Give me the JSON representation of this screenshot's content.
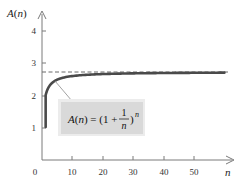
{
  "chart_data": {
    "type": "line",
    "title": "",
    "xlabel": "n",
    "ylabel": "A(n)",
    "xlim": [
      0,
      60
    ],
    "ylim": [
      0,
      4.6
    ],
    "x_ticks": [
      0,
      10,
      20,
      30,
      40,
      50
    ],
    "x_tick_labels": [
      "0",
      "10",
      "20",
      "30",
      "40",
      "50"
    ],
    "y_ticks": [
      1,
      2,
      3,
      4
    ],
    "y_tick_labels": [
      "1",
      "2",
      "3",
      "4"
    ],
    "grid": false,
    "legend": null,
    "series": [
      {
        "name": "A(n) = (1 + 1/n)^n",
        "function": "(1 + 1/n)^n",
        "domain": [
          1,
          60
        ],
        "x": [
          1,
          2,
          3,
          4,
          5,
          6,
          8,
          10,
          15,
          20,
          30,
          40,
          50,
          60
        ],
        "values": [
          2.0,
          2.25,
          2.37,
          2.441,
          2.488,
          2.522,
          2.566,
          2.594,
          2.633,
          2.653,
          2.674,
          2.685,
          2.692,
          2.696
        ],
        "color": "#4a4a4a"
      }
    ],
    "reference_lines": [
      {
        "type": "horizontal",
        "y": 2.718,
        "style": "dashed",
        "label": "e",
        "color": "#555555"
      }
    ],
    "annotations": [
      {
        "text_main": "A(n) = (1 + ",
        "frac_num": "1",
        "frac_den": "n",
        "text_close": ")",
        "exponent": "n",
        "box_fill": "#d9d9d9",
        "points_to_x": 4
      }
    ],
    "axis_labels": {
      "y_prefix": "A(",
      "y_var": "n",
      "y_suffix": ")",
      "x_var": "n"
    }
  }
}
